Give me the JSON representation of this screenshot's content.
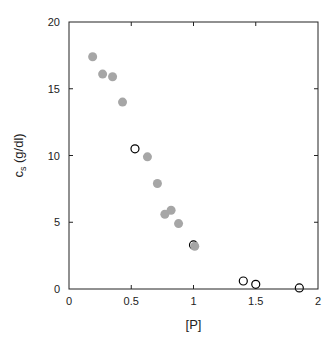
{
  "chart_data": {
    "type": "scatter",
    "title": "",
    "xlabel": "[P]",
    "ylabel": "c_s (g/dl)",
    "ylabel_main": "c",
    "ylabel_sub": "s",
    "ylabel_rest": " (g/dl)",
    "xlim": [
      0,
      2
    ],
    "ylim": [
      0,
      20
    ],
    "xticks": [
      0,
      0.5,
      1,
      1.5,
      2
    ],
    "xtick_labels": [
      "0",
      "0.5",
      "1",
      "1.5",
      "2"
    ],
    "yticks": [
      0,
      5,
      10,
      15,
      20
    ],
    "ytick_labels": [
      "0",
      "5",
      "10",
      "15",
      "20"
    ],
    "grid": false,
    "legend": null,
    "series": [
      {
        "name": "filled",
        "marker": "filled-circle",
        "color": "#a6a6a6",
        "x": [
          0.19,
          0.27,
          0.35,
          0.43,
          0.63,
          0.71,
          0.77,
          0.82,
          0.88,
          1.01
        ],
        "y": [
          17.4,
          16.1,
          15.9,
          14.0,
          9.9,
          7.9,
          5.6,
          5.9,
          4.9,
          3.2
        ]
      },
      {
        "name": "open",
        "marker": "open-circle",
        "color": "#000000",
        "x": [
          0.53,
          1.0,
          1.4,
          1.5,
          1.85
        ],
        "y": [
          10.5,
          3.3,
          0.6,
          0.35,
          0.08
        ]
      }
    ]
  }
}
